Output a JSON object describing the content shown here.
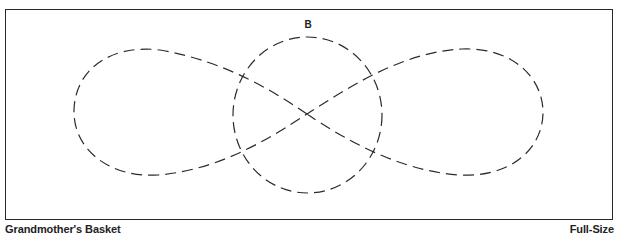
{
  "diagram": {
    "type": "quilting-template",
    "shape_label": "B",
    "pattern_name": "Grandmother's Basket",
    "scale_label": "Full-Size",
    "colors": {
      "stroke": "#2b2b2b",
      "border": "#2a2a2a",
      "text": "#222222",
      "background": "#ffffff"
    },
    "elements": [
      {
        "name": "figure-eight-loop",
        "style": "dashed",
        "description": "Horizontal figure-eight (infinity) loop with two lobes crossing at center"
      },
      {
        "name": "center-circle",
        "style": "dashed",
        "description": "Circle centered on the crossing point, labeled B"
      }
    ]
  }
}
